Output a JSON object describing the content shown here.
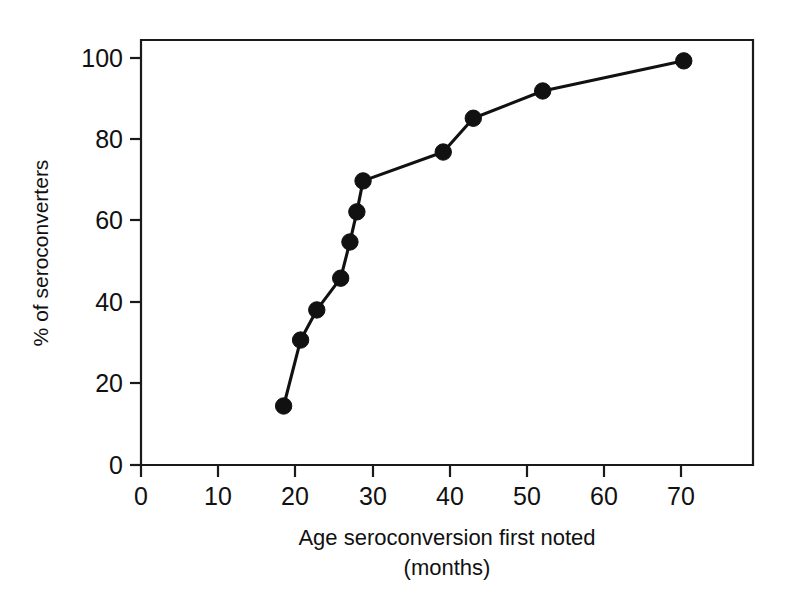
{
  "chart_data": {
    "type": "line",
    "title": "",
    "xlabel": "Age seroconversion  first noted",
    "xlabel_line2": "(months)",
    "ylabel": "% of seroconverters",
    "xlim": [
      0,
      79.4
    ],
    "ylim": [
      0,
      106
    ],
    "xticks": [
      0,
      10,
      20,
      30,
      40,
      50,
      60,
      70
    ],
    "xticklabels": [
      "0",
      "10",
      "20",
      "30",
      "40",
      "50",
      "60",
      "70"
    ],
    "yticks": [
      0,
      20,
      40,
      60,
      80,
      100
    ],
    "yticklabels": [
      "0",
      "20",
      "40",
      "60",
      "80",
      "100"
    ],
    "grid": false,
    "legend": null,
    "marker": "filled-circle",
    "series": [
      {
        "name": "cumulative seroconversion",
        "x": [
          18.5,
          20.7,
          22.8,
          25.9,
          27.1,
          28.0,
          28.8,
          39.2,
          43.1,
          52.1,
          70.4
        ],
        "y": [
          14.5,
          30.7,
          38.1,
          45.9,
          54.8,
          62.2,
          69.8,
          76.9,
          85.2,
          91.9,
          99.3
        ]
      }
    ]
  },
  "axes": {
    "x_title_line1": "Age seroconversion  first noted",
    "x_title_line2": "(months)",
    "y_title": "% of seroconverters"
  }
}
